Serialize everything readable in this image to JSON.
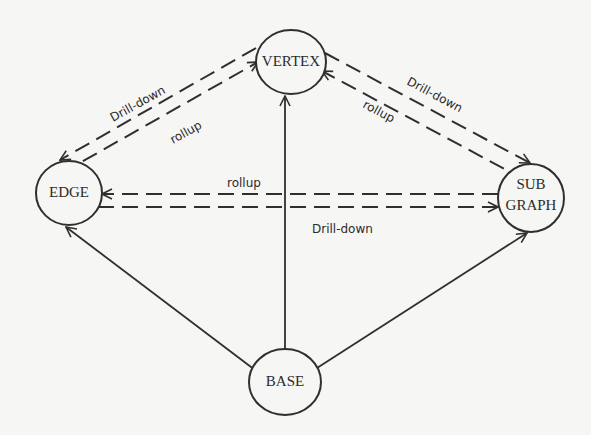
{
  "diagram": {
    "nodes": {
      "vertex": {
        "label": "VERTEX",
        "cx": 291,
        "cy": 62,
        "rx": 35,
        "ry": 32
      },
      "edge": {
        "label": "EDGE",
        "cx": 69,
        "cy": 193,
        "rx": 33,
        "ry": 32
      },
      "subgraph": {
        "label_line1": "SUB",
        "label_line2": "GRAPH",
        "cx": 531,
        "cy": 198,
        "rx": 33,
        "ry": 34
      },
      "base": {
        "label": "BASE",
        "cx": 285,
        "cy": 382,
        "rx": 36,
        "ry": 33
      }
    },
    "edge_labels": {
      "vertex_edge_drilldown": "Drill-down",
      "vertex_edge_rollup": "rollup",
      "vertex_subgraph_drilldown": "Drill-down",
      "vertex_subgraph_rollup": "rollup",
      "edge_subgraph_rollup": "rollup",
      "edge_subgraph_drilldown": "Drill-down"
    },
    "colors": {
      "stroke": "#2f2f2f",
      "background": "#f6f6f4"
    }
  }
}
